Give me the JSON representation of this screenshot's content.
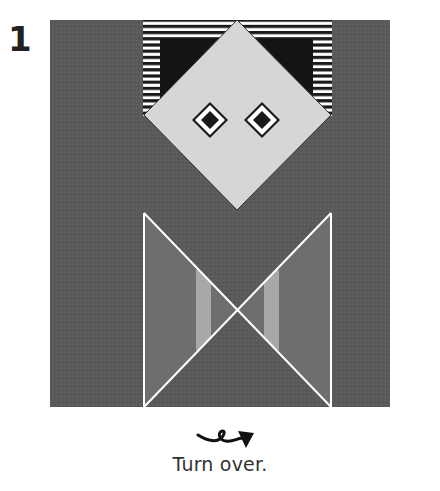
{
  "step": {
    "number": "1"
  },
  "instruction": {
    "text": "Turn over."
  },
  "figure": {
    "colors": {
      "paper_dark": "#5a5a5a",
      "paper_light": "#d6d6d6",
      "stripe_dark": "#1a1a1a",
      "stripe_light": "#ffffff",
      "inner_black": "#141414",
      "panel_mid": "#6e6e6e",
      "bar_light": "#a8a8a8",
      "fold_line": "#ffffff"
    }
  },
  "icons": {
    "turn_over": "turn-over-arrow-icon"
  }
}
